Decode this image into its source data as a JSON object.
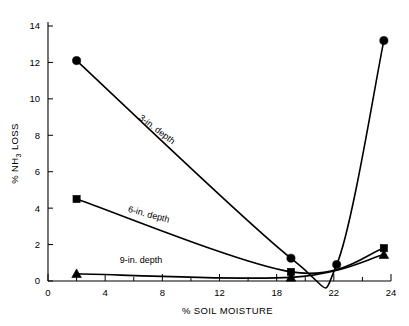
{
  "chart_data": {
    "type": "line",
    "title": "",
    "xlabel": "% SOIL MOISTURE",
    "ylabel": "% NH3 LOSS",
    "ylabel_parts": {
      "prefix": "% NH",
      "sub": "3",
      "suffix": " LOSS"
    },
    "xlim": [
      0,
      24
    ],
    "ylim": [
      0,
      14
    ],
    "xticks": [
      0,
      4,
      8,
      12,
      18,
      22,
      24
    ],
    "xticklabels": [
      "0",
      "4",
      "8",
      "12",
      "18",
      "22",
      "24"
    ],
    "xminor_step": 2,
    "yticks": [
      0,
      2,
      4,
      6,
      8,
      10,
      12,
      14
    ],
    "yticklabels": [
      "0",
      "2",
      "4",
      "6",
      "8",
      "10",
      "12",
      "14"
    ],
    "grid": false,
    "legend_position": "inline-annotations",
    "series": [
      {
        "name": "3-in. depth",
        "marker": "circle",
        "label": "3-in. depth",
        "x": [
          2.0,
          17.0,
          20.2,
          23.5
        ],
        "y": [
          12.1,
          1.25,
          0.9,
          13.2
        ]
      },
      {
        "name": "6-in. depth",
        "marker": "square",
        "label": "6-in. depth",
        "x": [
          2.0,
          17.0,
          23.5
        ],
        "y": [
          4.5,
          0.5,
          1.8
        ]
      },
      {
        "name": "9-in. depth",
        "marker": "triangle",
        "label": "9-in. depth",
        "x": [
          2.0,
          17.0,
          23.5
        ],
        "y": [
          0.4,
          0.2,
          1.45
        ]
      }
    ],
    "annotations": [
      {
        "text": "3-in. depth",
        "x": 7.5,
        "y": 8.2,
        "rotation": 37
      },
      {
        "text": "6-in. depth",
        "x": 7.0,
        "y": 3.5,
        "rotation": 15
      },
      {
        "text": "9-in. depth",
        "x": 6.5,
        "y": 1.0,
        "rotation": 0
      }
    ]
  }
}
